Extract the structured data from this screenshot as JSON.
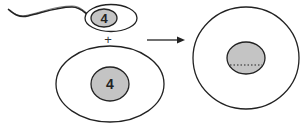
{
  "diagram": {
    "sperm": {
      "nucleus_label": "4"
    },
    "operator": "+",
    "egg": {
      "nucleus_label": "4"
    },
    "arrow": "→",
    "zygote": {
      "nucleus_label": ""
    },
    "colors": {
      "stroke": "#222222",
      "nucleus_fill": "#c4c4c4",
      "background": "#ffffff"
    }
  }
}
